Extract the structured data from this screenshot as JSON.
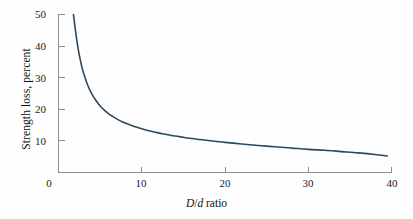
{
  "chart_data": {
    "type": "line",
    "title": "",
    "subtitle": "",
    "xlabel": "D/d ratio",
    "xlabel_parts": {
      "italic_first": "D",
      "separator": "/",
      "italic_second": "d",
      "roman_rest": " ratio"
    },
    "ylabel": "Strength loss, percent",
    "xlim": [
      0,
      40
    ],
    "ylim": [
      0,
      50
    ],
    "xticks": [
      0,
      10,
      20,
      30,
      40
    ],
    "xtick_labels": [
      "0",
      "10",
      "20",
      "30",
      "40"
    ],
    "yticks": [
      10,
      20,
      30,
      40,
      50
    ],
    "ytick_labels": [
      "10",
      "20",
      "30",
      "40",
      "50"
    ],
    "origin_tick_label": "0",
    "grid": false,
    "legend": null,
    "legend_position": "none",
    "tick_direction": "in",
    "series": [
      {
        "name": "Strength loss",
        "color": "#2d4a5c",
        "line_width": 1.6,
        "x": [
          1.8,
          2.0,
          2.25,
          2.5,
          2.75,
          3.0,
          3.5,
          4.0,
          4.5,
          5.0,
          5.5,
          6.0,
          6.5,
          7.0,
          7.5,
          8.0,
          9.0,
          10.0,
          11.0,
          12.0,
          13.0,
          14.0,
          15.0,
          16.0,
          17.0,
          18.0,
          19.0,
          20.0,
          22.0,
          24.0,
          26.0,
          28.0,
          30.0,
          32.0,
          34.0,
          36.0,
          38.0,
          39.5
        ],
        "y": [
          49.8,
          45.5,
          40.8,
          37.0,
          34.0,
          31.5,
          27.6,
          24.8,
          22.7,
          21.0,
          19.7,
          18.6,
          17.7,
          16.9,
          16.2,
          15.6,
          14.6,
          13.8,
          13.1,
          12.5,
          12.0,
          11.5,
          11.1,
          10.7,
          10.4,
          10.1,
          9.8,
          9.5,
          9.0,
          8.5,
          8.1,
          7.7,
          7.3,
          7.0,
          6.6,
          6.2,
          5.7,
          5.2
        ]
      }
    ],
    "axis_color": "#8e8e8e",
    "background_color": "#fefefe"
  },
  "figure": {
    "caption": ""
  }
}
